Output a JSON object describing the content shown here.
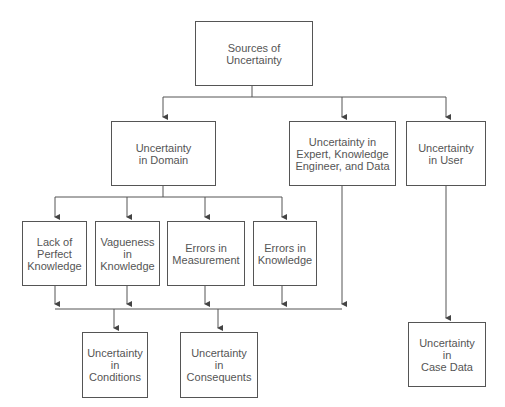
{
  "diagram": {
    "root": "Sources of\nUncertainty",
    "level1": [
      "Uncertainty\nin Domain",
      "Uncertainty in\nExpert, Knowledge\nEngineer, and Data",
      "Uncertainty\nin User"
    ],
    "domain_children": [
      "Lack of\nPerfect\nKnowledge",
      "Vagueness\nin\nKnowledge",
      "Errors in\nMeasurement",
      "Errors in\nKnowledge"
    ],
    "outcomes": [
      "Uncertainty\nin\nConditions",
      "Uncertainty\nin\nConsequents",
      "Uncertainty\nin\nCase Data"
    ],
    "colors": {
      "line": "#555555",
      "text": "#555555",
      "background": "#ffffff"
    }
  }
}
